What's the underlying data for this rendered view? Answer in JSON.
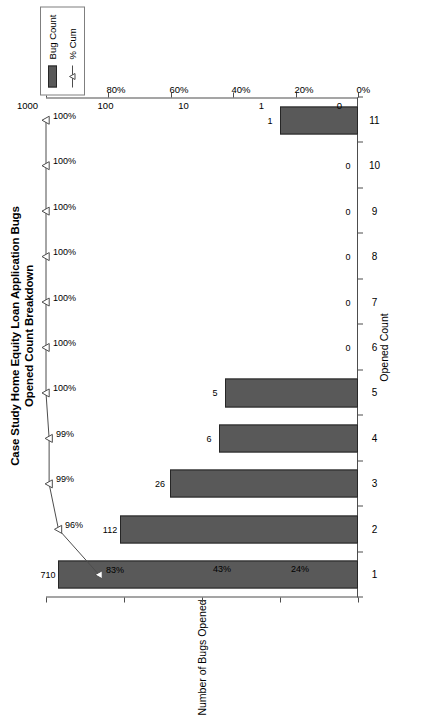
{
  "chart_data": {
    "type": "bar",
    "title": "Case Study Home Equity Loan Application Bugs",
    "subtitle": "Opened Count Breakdown",
    "xlabel": "Opened Count",
    "ylabel": "Number of Bugs Opened",
    "y2label": "",
    "categories": [
      "1",
      "2",
      "3",
      "4",
      "5",
      "6",
      "7",
      "8",
      "9",
      "10",
      "11"
    ],
    "series": [
      {
        "name": "Bug Count",
        "type": "bar",
        "values": [
          710,
          112,
          26,
          6,
          5,
          0,
          0,
          0,
          0,
          0,
          1
        ],
        "labels": [
          "710",
          "112",
          "26",
          "6",
          "5",
          "0",
          "0",
          "0",
          "0",
          "0",
          "1"
        ],
        "color": "#595959"
      },
      {
        "name": "% Cum",
        "type": "line",
        "values": [
          83,
          96,
          99,
          99,
          100,
          100,
          100,
          100,
          100,
          100,
          100
        ],
        "labels": [
          "83%",
          "96%",
          "99%",
          "99%",
          "100%",
          "100%",
          "100%",
          "100%",
          "100%",
          "100%",
          "100%"
        ],
        "color": "#4d4d4d"
      }
    ],
    "extra_annotations": [
      "43%",
      "24%"
    ],
    "yticks": [
      "1000",
      "100",
      "10",
      "1",
      "0"
    ],
    "y2ticks": [
      "100%",
      "80%",
      "60%",
      "40%",
      "20%",
      "0%"
    ],
    "yscale": "log",
    "ylim": [
      0,
      1000
    ],
    "y2lim": [
      0,
      100
    ],
    "grid": false,
    "legend_position": "top-right"
  },
  "legend": {
    "entries": [
      {
        "label": "Bug Count",
        "marker": "bar-swatch-icon"
      },
      {
        "label": "% Cum",
        "marker": "line-triangle-marker-icon"
      }
    ]
  }
}
